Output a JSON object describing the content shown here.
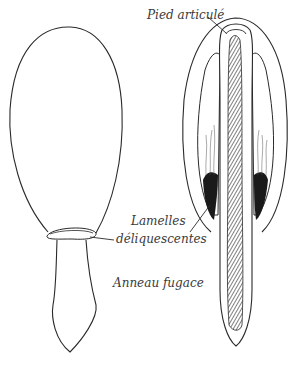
{
  "figure": {
    "type": "mushroom-illustration",
    "labels": [
      {
        "id": "pied",
        "text": "Pied articulé"
      },
      {
        "id": "lamelles_1",
        "text": "Lamelles"
      },
      {
        "id": "lamelles_2",
        "text": "déliquescentes"
      },
      {
        "id": "anneau",
        "text": "Anneau fugace"
      }
    ],
    "colors": {
      "line": "#2a2a2a",
      "hatch": "#3a3a3a",
      "gills_dark": "#1a1a1a",
      "background": "#ffffff"
    }
  }
}
